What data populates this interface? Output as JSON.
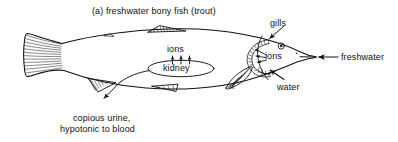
{
  "figure": {
    "title": "(a) freshwater bony fish (trout)",
    "background_color": "#ffffff",
    "ink_color": "#111111"
  },
  "labels": {
    "gills": "gills",
    "ions_gill": "ions",
    "freshwater": "freshwater",
    "water": "water",
    "ions_kidney": "ions",
    "kidney": "kidney",
    "urine_line1": "copious urine,",
    "urine_line2": "hypotonic to blood"
  },
  "annotations": {
    "gills_arrow": "arrow-down-left-to-gills",
    "freshwater_arrow": "arrow-left-into-mouth",
    "water_arrow": "arrow-up-left-to-gills",
    "ions_gill_arrows": "arrows-out-of-gills",
    "ions_kidney_arrows": "three-up-arrows",
    "urine_arrow": "arrow-down-left-from-vent"
  },
  "anatomy": {
    "body": "fish-body-outline",
    "caudal_fin": "forked-tail-fin",
    "dorsal_fin": "dorsal-fin",
    "adipose_fin": "adipose-fin",
    "anal_fin": "anal-fin",
    "pectoral_fin": "pectoral-fin",
    "gill_arches": "gill-filament-arches",
    "eye": "fish-eye",
    "kidney_organ": "kidney-oval",
    "urinary_duct": "urinary-duct"
  }
}
